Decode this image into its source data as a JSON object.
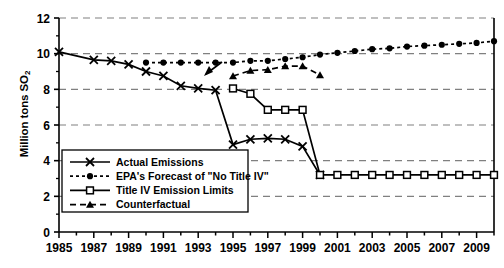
{
  "chart_data": {
    "type": "line",
    "title": "",
    "xlabel": "",
    "ylabel": "Million tons SO2",
    "ylabel_main": "Million tons SO",
    "ylabel_sub": "2",
    "xlim": [
      1985,
      2010
    ],
    "ylim": [
      0,
      12
    ],
    "yticks": [
      0,
      2,
      4,
      6,
      8,
      10,
      12
    ],
    "xticks": [
      1985,
      1986,
      1987,
      1988,
      1989,
      1990,
      1991,
      1992,
      1993,
      1994,
      1995,
      1996,
      1997,
      1998,
      1999,
      2000,
      2001,
      2002,
      2003,
      2004,
      2005,
      2006,
      2007,
      2008,
      2009,
      2010
    ],
    "xtick_labels": [
      "1985",
      "",
      "1987",
      "",
      "1989",
      "",
      "1991",
      "",
      "1993",
      "",
      "1995",
      "",
      "1997",
      "",
      "1999",
      "",
      "2001",
      "",
      "2003",
      "",
      "2005",
      "",
      "2007",
      "",
      "2009",
      ""
    ],
    "grid": true,
    "grid_style": "dashed-horizontal",
    "legend_position": "lower-left",
    "series": [
      {
        "name": "Actual Emissions",
        "marker": "x",
        "line": "solid",
        "x": [
          1985,
          1987,
          1988,
          1989,
          1990,
          1991,
          1992,
          1993,
          1994,
          1995,
          1996,
          1997,
          1998,
          1999,
          2000
        ],
        "values": [
          10.1,
          9.65,
          9.6,
          9.4,
          9.0,
          8.75,
          8.2,
          8.05,
          7.95,
          4.9,
          5.2,
          5.25,
          5.2,
          4.8,
          3.2
        ]
      },
      {
        "name": "EPA's Forecast of \"No Title IV\"",
        "marker": "circle",
        "line": "dotted",
        "x": [
          1990,
          1991,
          1992,
          1993,
          1994,
          1995,
          1996,
          1997,
          1998,
          1999,
          2000,
          2001,
          2002,
          2003,
          2004,
          2005,
          2006,
          2007,
          2008,
          2009,
          2010
        ],
        "values": [
          9.5,
          9.5,
          9.5,
          9.5,
          9.5,
          9.5,
          9.6,
          9.6,
          9.7,
          9.8,
          9.95,
          10.05,
          10.15,
          10.25,
          10.3,
          10.4,
          10.45,
          10.5,
          10.55,
          10.6,
          10.7
        ]
      },
      {
        "name": "Title IV Emission Limits",
        "marker": "square",
        "line": "solid",
        "x": [
          1995,
          1996,
          1997,
          1998,
          1999,
          2000,
          2001,
          2002,
          2003,
          2004,
          2005,
          2006,
          2007,
          2008,
          2009,
          2010
        ],
        "values": [
          8.05,
          7.75,
          6.85,
          6.85,
          6.85,
          3.2,
          3.2,
          3.2,
          3.2,
          3.2,
          3.2,
          3.2,
          3.2,
          3.2,
          3.2,
          3.2
        ]
      },
      {
        "name": "Counterfactual",
        "marker": "triangle",
        "line": "dashed",
        "x": [
          1995,
          1996,
          1997,
          1998,
          1999,
          2000
        ],
        "values": [
          8.75,
          9.05,
          9.1,
          9.3,
          9.3,
          8.8
        ]
      }
    ],
    "legend": [
      {
        "label": "Actual Emissions",
        "marker": "x",
        "line": "solid"
      },
      {
        "label": "EPA's Forecast of \"No Title IV\"",
        "marker": "circle",
        "line": "dotted"
      },
      {
        "label": "Title IV Emission Limits",
        "marker": "square",
        "line": "solid"
      },
      {
        "label": "Counterfactual",
        "marker": "triangle",
        "line": "dashed"
      }
    ],
    "colors": {
      "line": "#000000",
      "grid": "#808080",
      "axis": "#000000",
      "background": "#ffffff"
    }
  }
}
